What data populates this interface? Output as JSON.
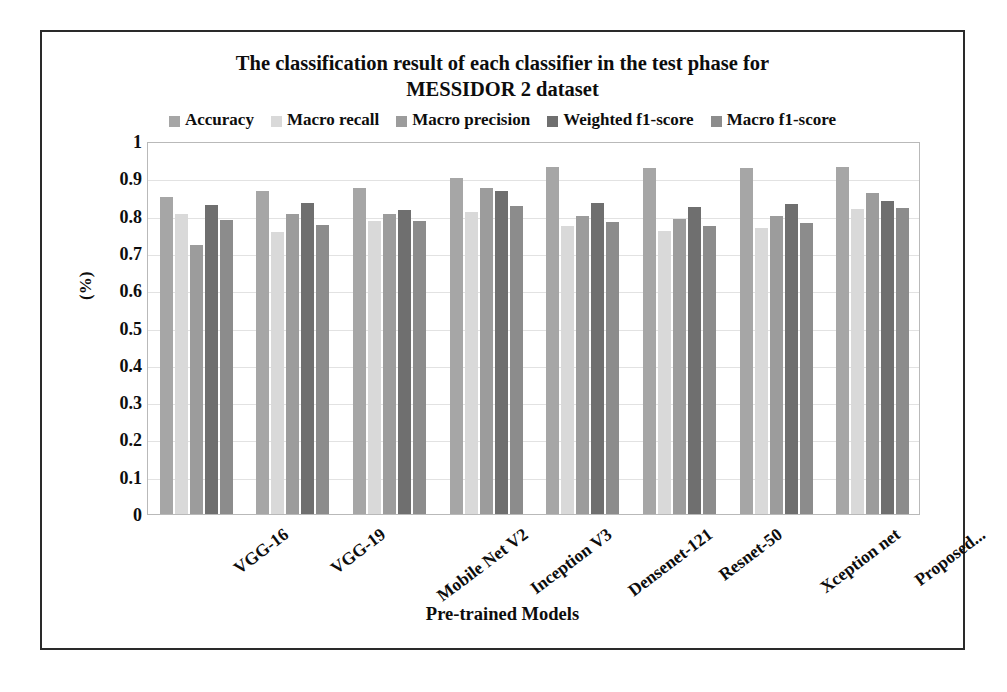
{
  "chart_data": {
    "type": "bar",
    "title": "The classification result of each classifier in the test phase for MESSIDOR 2 dataset",
    "title_lines": [
      "The classification result of each classifier in the test phase for",
      "MESSIDOR 2 dataset"
    ],
    "xlabel": "Pre-trained Models",
    "ylabel": "(%)",
    "ylim": [
      0,
      1
    ],
    "yticks": [
      "1",
      "0.9",
      "0.8",
      "0.7",
      "0.6",
      "0.5",
      "0.4",
      "0.3",
      "0.2",
      "0.1",
      "0"
    ],
    "ytick_values": [
      1,
      0.9,
      0.8,
      0.7,
      0.6,
      0.5,
      0.4,
      0.3,
      0.2,
      0.1,
      0
    ],
    "grid": true,
    "legend_position": "top",
    "categories": [
      "VGG-16",
      "VGG-19",
      "Mobile Net V2",
      "Inception V3",
      "Densenet-121",
      "Resnet-50",
      "Xception net",
      "Proposed..."
    ],
    "series": [
      {
        "name": "Accuracy",
        "color": "#a6a6a6",
        "values": [
          0.85,
          0.865,
          0.875,
          0.9,
          0.93,
          0.928,
          0.928,
          0.93
        ]
      },
      {
        "name": "Macro recall",
        "color": "#d9d9d9",
        "values": [
          0.805,
          0.755,
          0.785,
          0.81,
          0.772,
          0.758,
          0.768,
          0.818
        ]
      },
      {
        "name": "Macro precision",
        "color": "#9c9c9c",
        "values": [
          0.722,
          0.805,
          0.805,
          0.875,
          0.8,
          0.79,
          0.8,
          0.86
        ]
      },
      {
        "name": "Weighted f1-score",
        "color": "#6f6f6f",
        "values": [
          0.828,
          0.835,
          0.815,
          0.865,
          0.835,
          0.822,
          0.83,
          0.84
        ]
      },
      {
        "name": "Macro f1-score",
        "color": "#8c8c8c",
        "values": [
          0.788,
          0.775,
          0.785,
          0.825,
          0.782,
          0.772,
          0.78,
          0.82
        ]
      }
    ]
  },
  "colors": {
    "frame": "#2a2a2a",
    "plot_border": "#b9b9b9",
    "gridline": "#e2e2e2",
    "text": "#0d0d0d",
    "background": "#ffffff"
  }
}
